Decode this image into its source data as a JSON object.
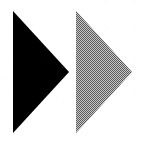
{
  "figure": {
    "background_color": "#ffffff",
    "width": 142,
    "height": 146,
    "alt_text": "Two solid right-pointing triangles side by side, the left one black and the right one halftone gray"
  },
  "shapes": [
    {
      "name": "black-triangle",
      "role": "left arrow",
      "direction": "right",
      "fill_color": "#000000",
      "fill_style": "solid",
      "points": "13,11 13,133 69,72",
      "apex_top": [
        13,
        11
      ],
      "apex_bottom": [
        13,
        133
      ],
      "tip": [
        69,
        72
      ]
    },
    {
      "name": "gray-triangle",
      "role": "right arrow",
      "direction": "right",
      "fill_color": "#808080",
      "fill_style": "halftone-dither",
      "points": "76,11 76,133 132,72",
      "apex_top": [
        76,
        11
      ],
      "apex_bottom": [
        76,
        133
      ],
      "tip": [
        132,
        72
      ]
    }
  ],
  "colors": {
    "black": "#000000",
    "gray": "#808080",
    "gray_dither_light": "#b4b4b4",
    "gray_dither_dark": "#4a4a4a",
    "background": "#ffffff"
  }
}
